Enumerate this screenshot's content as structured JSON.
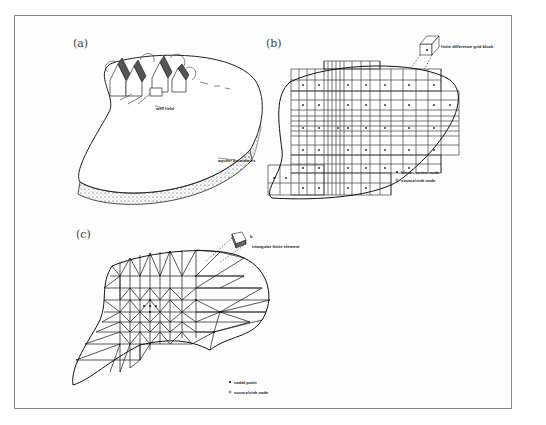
{
  "figure": {
    "panels": [
      {
        "id": "a",
        "label": "(a)",
        "title": "Conceptual aquifer",
        "annotations": [
          "well field",
          "aquifer boundaries"
        ]
      },
      {
        "id": "b",
        "label": "(b)",
        "title": "Finite-difference grid",
        "annotations": [
          "finite difference grid block",
          "Δx",
          "Δy",
          "b"
        ],
        "legend": [
          {
            "symbol": "filled-dot",
            "text": "block - center node"
          },
          {
            "symbol": "open-dot",
            "text": "source/sink node"
          }
        ]
      },
      {
        "id": "c",
        "label": "(c)",
        "title": "Finite-element mesh",
        "annotations": [
          "triangular finite element",
          "b"
        ],
        "legend": [
          {
            "symbol": "filled-dot",
            "text": "nodal point"
          },
          {
            "symbol": "open-dot",
            "text": "source/sink node"
          }
        ]
      }
    ],
    "colors": {
      "ink": "#1a1a1a",
      "frame": "#8a8a8a",
      "paper": "#fdfdfd"
    }
  }
}
